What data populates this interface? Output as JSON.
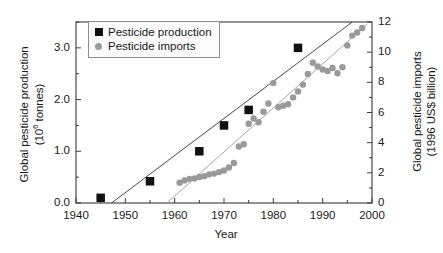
{
  "chart_data": {
    "type": "scatter",
    "title": "",
    "xlabel": "Year",
    "ylabel": "Global pesticide production (10⁶ tonnes)",
    "ylabel_line1": "Global pesticide production",
    "ylabel_line2_pre": "(10",
    "ylabel_line2_sup": "6",
    "ylabel_line2_post": " tonnes)",
    "y2label": "Global pesticide imports (1996 US$ billion)",
    "y2label_line1": "Global pesticide imports",
    "y2label_line2": "(1996 US$ billion)",
    "xlim": [
      1940,
      2000
    ],
    "ylim": [
      0.0,
      3.5
    ],
    "y2lim": [
      0,
      12
    ],
    "grid": false,
    "legend_position": "top-left",
    "xticks": [
      1940,
      1950,
      1960,
      1970,
      1980,
      1990,
      2000
    ],
    "xtick_labels": [
      "1940",
      "1950",
      "1960",
      "1970",
      "1980",
      "1990",
      "2000"
    ],
    "xminor_step": 5,
    "yticks": [
      0.0,
      1.0,
      2.0,
      3.0
    ],
    "ytick_labels": [
      "0.0",
      "1.0",
      "2.0",
      "3.0"
    ],
    "yminor_step": 0.5,
    "y2ticks": [
      0,
      2,
      4,
      6,
      8,
      10,
      12
    ],
    "y2tick_labels": [
      "0",
      "2",
      "4",
      "6",
      "8",
      "10",
      "12"
    ],
    "y2minor_step": 1,
    "series": [
      {
        "name": "Pesticide production",
        "marker": "square",
        "color": "#111111",
        "axis": "left",
        "units": "10^6 tonnes",
        "x": [
          1945,
          1955,
          1965,
          1970,
          1975,
          1985
        ],
        "values": [
          0.1,
          0.42,
          1.0,
          1.5,
          1.8,
          3.0
        ]
      },
      {
        "name": "Pesticide imports",
        "marker": "circle",
        "color": "#9a9a9a",
        "axis": "right",
        "units": "1996 US$ billion",
        "x": [
          1961,
          1962,
          1963,
          1964,
          1965,
          1966,
          1967,
          1968,
          1969,
          1970,
          1971,
          1972,
          1973,
          1974,
          1975,
          1976,
          1977,
          1978,
          1979,
          1980,
          1981,
          1982,
          1983,
          1984,
          1985,
          1986,
          1987,
          1988,
          1989,
          1990,
          1991,
          1992,
          1993,
          1994,
          1995,
          1996,
          1997,
          1998
        ],
        "values": [
          1.35,
          1.5,
          1.6,
          1.62,
          1.72,
          1.78,
          1.9,
          1.95,
          2.05,
          2.15,
          2.35,
          2.65,
          3.75,
          3.9,
          5.25,
          5.6,
          5.35,
          6.05,
          6.6,
          7.95,
          6.35,
          6.45,
          6.55,
          7.0,
          7.4,
          7.85,
          8.55,
          9.3,
          9.05,
          8.85,
          8.75,
          8.95,
          8.6,
          9.0,
          10.45,
          11.1,
          11.3,
          11.6
        ]
      }
    ],
    "trend_lines": [
      {
        "name": "production-trend",
        "color": "#333333",
        "x_start": 1947.2,
        "y_start": 0.0,
        "x_end": 1996.0,
        "y_end": 3.5,
        "axis": "left"
      },
      {
        "name": "imports-trend",
        "color": "#9a9a9a",
        "x_start": 1958.4,
        "y_start": 0.0,
        "x_end": 1999.0,
        "y_end": 11.85,
        "axis": "right"
      }
    ],
    "legend": [
      {
        "label": "Pesticide production",
        "marker": "square",
        "color": "#111111"
      },
      {
        "label": "Pesticide imports",
        "marker": "circle",
        "color": "#9a9a9a"
      }
    ]
  }
}
